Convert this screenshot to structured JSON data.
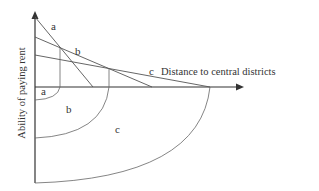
{
  "diagram": {
    "type": "bid-rent-curves",
    "x_axis_label": "Distance to central districts",
    "y_axis_label": "Ability of paying rent",
    "curve_labels": {
      "a": "a",
      "b": "b",
      "c": "c"
    },
    "zone_labels": {
      "a": "a",
      "b": "b",
      "c": "c"
    },
    "colors": {
      "line": "#333333",
      "thin_line": "#555555",
      "background": "#ffffff"
    }
  }
}
